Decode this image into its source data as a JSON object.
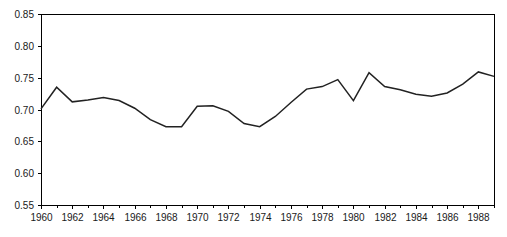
{
  "chart_data": {
    "type": "line",
    "title": "",
    "subtitle": "",
    "xlabel": "",
    "ylabel": "",
    "xlim": [
      1960,
      1989
    ],
    "ylim": [
      0.55,
      0.85
    ],
    "grid": false,
    "legend": null,
    "legend_position": "none",
    "y_ticks": [
      0.55,
      0.6,
      0.65,
      0.7,
      0.75,
      0.8,
      0.85
    ],
    "y_tick_labels": [
      "0.55",
      "0.60",
      "0.65",
      "0.70",
      "0.75",
      "0.80",
      "0.85"
    ],
    "x_ticks": [
      1960,
      1962,
      1964,
      1966,
      1968,
      1970,
      1972,
      1974,
      1976,
      1978,
      1980,
      1982,
      1984,
      1986,
      1988
    ],
    "x_tick_labels": [
      "1960",
      "1962",
      "1964",
      "1966",
      "1968",
      "1970",
      "1972",
      "1974",
      "1976",
      "1978",
      "1980",
      "1982",
      "1984",
      "1986",
      "1988"
    ],
    "x_minor_tick_interval": 1,
    "line_color": "#222222",
    "axis_color": "#000000",
    "background_color": "#ffffff",
    "x": [
      1960,
      1961,
      1962,
      1963,
      1964,
      1965,
      1966,
      1967,
      1968,
      1969,
      1970,
      1971,
      1972,
      1973,
      1974,
      1975,
      1976,
      1977,
      1978,
      1979,
      1980,
      1981,
      1982,
      1983,
      1984,
      1985,
      1986,
      1987,
      1988,
      1989
    ],
    "values": [
      0.701,
      0.735,
      0.712,
      0.715,
      0.719,
      0.714,
      0.702,
      0.684,
      0.673,
      0.673,
      0.705,
      0.706,
      0.697,
      0.678,
      0.673,
      0.689,
      0.711,
      0.732,
      0.736,
      0.747,
      0.714,
      0.758,
      0.736,
      0.731,
      0.724,
      0.721,
      0.726,
      0.74,
      0.759,
      0.752
    ],
    "series": [
      {
        "name": "series-1",
        "values": [
          0.701,
          0.735,
          0.712,
          0.715,
          0.719,
          0.714,
          0.702,
          0.684,
          0.673,
          0.673,
          0.705,
          0.706,
          0.697,
          0.678,
          0.673,
          0.689,
          0.711,
          0.732,
          0.736,
          0.747,
          0.714,
          0.758,
          0.736,
          0.731,
          0.724,
          0.721,
          0.726,
          0.74,
          0.759,
          0.752
        ]
      }
    ]
  },
  "plot_geometry": {
    "left": 41,
    "right": 494,
    "top": 14,
    "bottom": 205
  }
}
